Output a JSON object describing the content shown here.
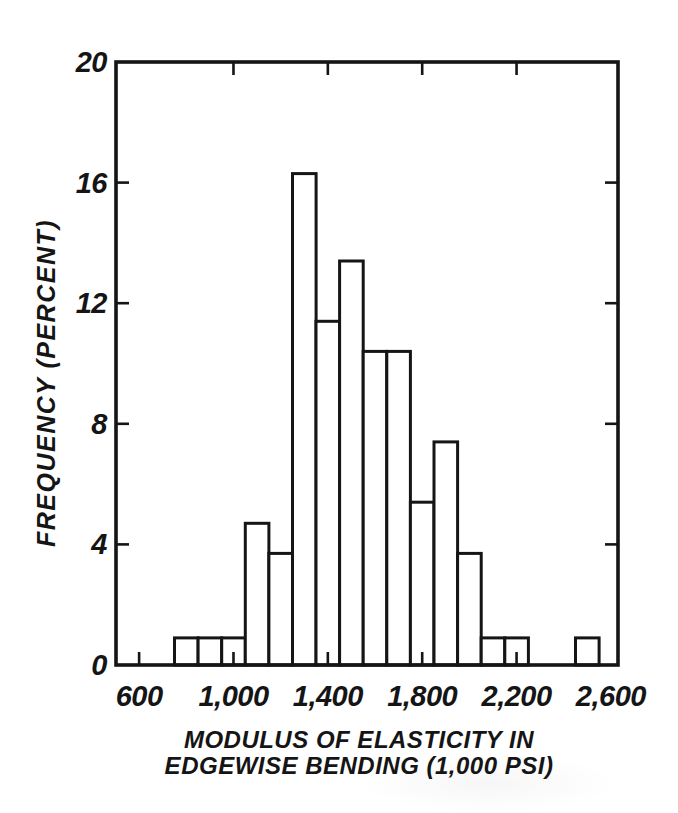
{
  "figure": {
    "background_color": "#ffffff",
    "ink_color": "#151515"
  },
  "chart_data": {
    "type": "bar",
    "subtype": "histogram",
    "title": "",
    "xlabel_line1": "MODULUS OF ELASTICITY IN",
    "xlabel_line2": "EDGEWISE BENDING (1,000 PSI)",
    "ylabel": "FREQUENCY (PERCENT)",
    "bin_width": 100,
    "bin_centers": [
      800,
      900,
      1000,
      1100,
      1200,
      1300,
      1400,
      1500,
      1600,
      1700,
      1800,
      1900,
      2000,
      2100,
      2200,
      2300,
      2400,
      2500
    ],
    "values": [
      0.9,
      0.9,
      0.9,
      4.7,
      3.7,
      16.3,
      11.4,
      13.4,
      10.4,
      10.4,
      5.4,
      7.4,
      3.7,
      0.9,
      0.9,
      0,
      0,
      0.9
    ],
    "x_ticks": [
      {
        "value": 600,
        "label": "600"
      },
      {
        "value": 1000,
        "label": "1,000"
      },
      {
        "value": 1400,
        "label": "1,400"
      },
      {
        "value": 1800,
        "label": "1,800"
      },
      {
        "value": 2200,
        "label": "2,200"
      },
      {
        "value": 2600,
        "label": "2,600"
      }
    ],
    "y_ticks": [
      {
        "value": 0,
        "label": "0"
      },
      {
        "value": 4,
        "label": "4"
      },
      {
        "value": 8,
        "label": "8"
      },
      {
        "value": 12,
        "label": "12"
      },
      {
        "value": 16,
        "label": "16"
      },
      {
        "value": 20,
        "label": "20"
      }
    ],
    "bottom_tick_values": [
      600,
      1000,
      1400,
      1800,
      2200
    ],
    "top_tick_values": [
      1000,
      1400,
      1800,
      2200
    ],
    "side_tick_values": [
      4,
      8,
      12,
      16
    ],
    "xlim": [
      502,
      2630
    ],
    "ylim": [
      0,
      20
    ],
    "grid": false,
    "legend": "none",
    "bar_fill": "#ffffff"
  }
}
